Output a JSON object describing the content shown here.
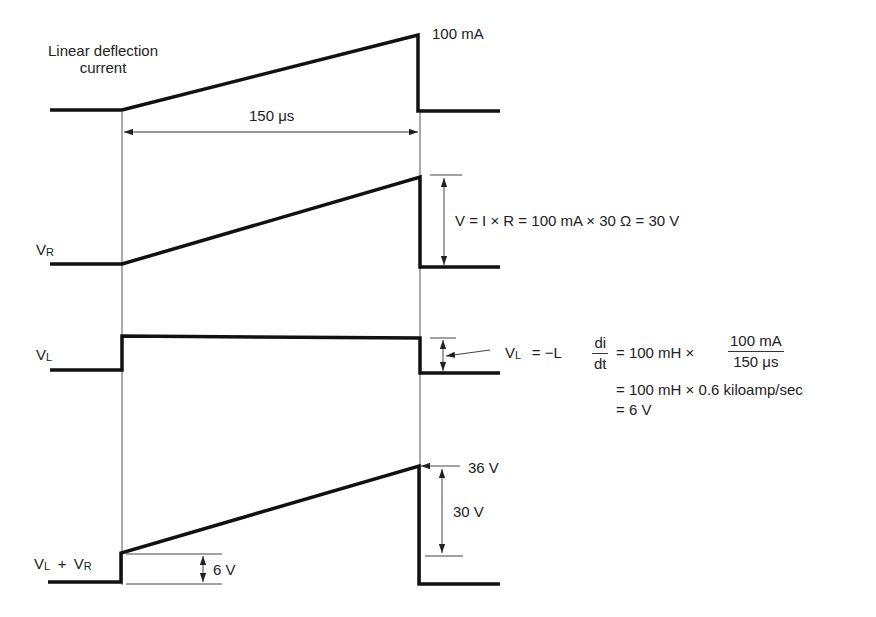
{
  "figure": {
    "colors": {
      "waveform": "#111111",
      "dimension_line": "#555555",
      "text": "#222222",
      "background": "#ffffff"
    }
  },
  "waveforms": {
    "current": {
      "label_line1": "Linear deflection",
      "label_line2": "current",
      "peak_label": "100 mA",
      "duration_label": "150 μs",
      "shape": "sawtooth"
    },
    "vr": {
      "label_main": "V",
      "label_sub": "R",
      "shape": "sawtooth",
      "equation": "V = I × R = 100 mA × 30 Ω = 30 V"
    },
    "vl": {
      "label_main": "V",
      "label_sub": "L",
      "shape": "rectangular pulse",
      "equation": {
        "lhs_main": "V",
        "lhs_sub": "L",
        "eq_prefix": "= −L",
        "deriv_num": "di",
        "deriv_den": "dt",
        "step1_prefix": "= 100 mH ×",
        "step1_num": "100 mA",
        "step1_den": "150 μs",
        "step2": "= 100 mH × 0.6 kiloamp/sec",
        "step3": "= 6 V"
      }
    },
    "sum": {
      "label_v1": "V",
      "label_s1": "L",
      "label_plus": "+",
      "label_v2": "V",
      "label_s2": "R",
      "shape": "step + sawtooth",
      "peak_label": "36 V",
      "ramp_label": "30 V",
      "step_label": "6 V"
    }
  },
  "values": {
    "peak_current_mA": 100,
    "scan_time_us": 150,
    "resistance_ohm": 30,
    "inductance_mH": 100,
    "di_dt_kA_per_s": 0.6,
    "vr_peak_V": 30,
    "vl_V": 6,
    "sum_peak_V": 36
  }
}
